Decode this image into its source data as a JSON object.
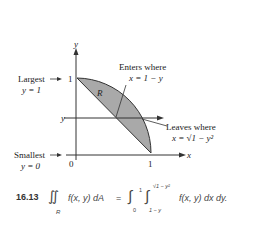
{
  "figure": {
    "axes": {
      "x_label": "x",
      "y_label": "y",
      "x_tick_0": "0",
      "x_tick_1": "1",
      "y_tick_1": "1",
      "y_marker": "y"
    },
    "region_label": "R",
    "annotations": {
      "largest_line1": "Largest",
      "largest_line2": "y = 1",
      "smallest_line1": "Smallest",
      "smallest_line2": "y = 0",
      "enters_line1": "Enters where",
      "enters_line2": "x = 1 − y",
      "leaves_line1": "Leaves where",
      "leaves_line2": "x = √1 − y²"
    },
    "colors": {
      "region_fill": "#a9a9a9",
      "line": "#333333"
    }
  },
  "equation": {
    "number": "16.13",
    "lhs": "∬",
    "lhs_sub": "R",
    "lhs_integrand": "f(x, y) dA",
    "equals": "=",
    "outer_int": "∫",
    "outer_upper": "1",
    "outer_lower": "0",
    "inner_int": "∫",
    "inner_upper": "√1 − y²",
    "inner_lower": "1 − y",
    "rhs_integrand": "f(x, y) dx dy."
  }
}
